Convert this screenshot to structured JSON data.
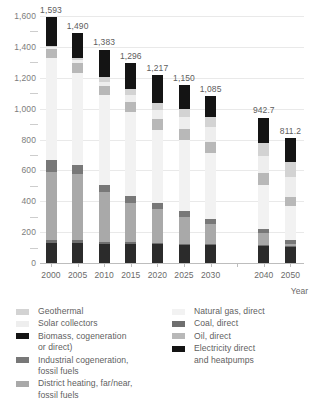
{
  "chart_data": {
    "type": "bar",
    "stacked": true,
    "title": "",
    "subtitle": "",
    "xlabel": "Year",
    "ylabel": "",
    "ylim": [
      0,
      1600
    ],
    "ytick_step": 200,
    "yminor_step": 100,
    "grid": true,
    "legend_position": "bottom",
    "ytick_labels": [
      "0",
      "200",
      "400",
      "600",
      "800",
      "1,000",
      "1,200",
      "1,400",
      "1,600"
    ],
    "categories": [
      "2000",
      "2005",
      "2010",
      "2015",
      "2020",
      "2025",
      "2030",
      "2040",
      "2050"
    ],
    "category_gap_after": "2030",
    "totals": [
      "1,593",
      "1,490",
      "1,383",
      "1,296",
      "1,217",
      "1,150",
      "1,085",
      "942.7",
      "811.2"
    ],
    "totals_numeric": [
      1593,
      1490,
      1383,
      1296,
      1217,
      1150,
      1085,
      942.7,
      811.2
    ],
    "series": [
      {
        "name": "Electricity direct and heatpumps",
        "color": "#2b2b2b",
        "values": [
          130,
          131,
          126,
          125,
          124,
          120,
          118,
          112,
          105
        ]
      },
      {
        "name": "Coal, direct",
        "color": "#6f6f6f",
        "values": [
          20,
          16,
          12,
          10,
          8,
          6,
          5,
          6,
          3
        ]
      },
      {
        "name": "District heating, far/near, fossil fuels",
        "color": "#a9a9a9",
        "values": [
          440,
          430,
          320,
          255,
          215,
          175,
          130,
          75,
          18
        ]
      },
      {
        "name": "Industrial cogeneration, fossil fuels",
        "color": "#787878",
        "values": [
          75,
          55,
          50,
          45,
          45,
          35,
          35,
          25,
          22
        ]
      },
      {
        "name": "Natural gas, direct",
        "color": "#f2f2f2",
        "values": [
          660,
          600,
          580,
          545,
          470,
          460,
          425,
          285,
          222
        ]
      },
      {
        "name": "Oil, direct",
        "color": "#b8b8b8",
        "values": [
          62,
          66,
          60,
          66,
          70,
          72,
          72,
          80,
          60
        ]
      },
      {
        "name": "Solar collectors",
        "color": "#eeeeee",
        "values": [
          10,
          16,
          25,
          42,
          60,
          75,
          95,
          110,
          130
        ]
      },
      {
        "name": "Geothermal",
        "color": "#d3d3d3",
        "values": [
          6,
          16,
          30,
          38,
          45,
          57,
          65,
          84,
          96
        ]
      },
      {
        "name": "Biomass, cogeneration or direct)",
        "color": "#141414",
        "values": [
          190,
          160,
          180,
          170,
          180,
          150,
          140,
          165,
          155
        ]
      }
    ]
  },
  "legend": {
    "left": [
      {
        "label": "Geothermal",
        "name": "geothermal",
        "color": "#d3d3d3"
      },
      {
        "label": "Solar collectors",
        "name": "solar-collectors",
        "color": "#eeeeee"
      },
      {
        "label": "Biomass, cogeneration\nor direct)",
        "name": "biomass",
        "color": "#141414"
      },
      {
        "label": "Industrial cogeneration,\nfossil fuels",
        "name": "industrial-cogeneration",
        "color": "#787878"
      },
      {
        "label": "District heating, far/near,\nfossil fuels",
        "name": "district-heating",
        "color": "#a9a9a9"
      }
    ],
    "right": [
      {
        "label": "Natural gas, direct",
        "name": "natural-gas-direct",
        "color": "#f2f2f2"
      },
      {
        "label": "Coal, direct",
        "name": "coal-direct",
        "color": "#6f6f6f"
      },
      {
        "label": "Oil, direct",
        "name": "oil-direct",
        "color": "#b8b8b8"
      },
      {
        "label": "Electricity direct\nand heatpumps",
        "name": "electricity-direct-heatpumps",
        "color": "#141414"
      }
    ]
  }
}
